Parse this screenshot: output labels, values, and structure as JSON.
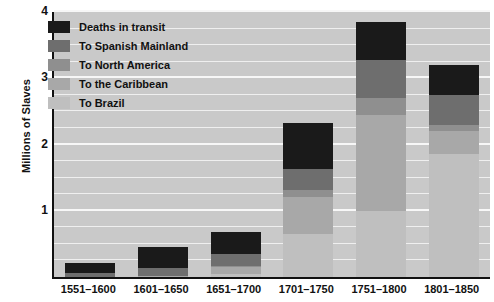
{
  "chart_data": {
    "type": "bar",
    "subtype": "stacked-bar",
    "title": "",
    "xlabel": "",
    "ylabel": "Millions of Slaves",
    "ylim": [
      0,
      4
    ],
    "yticks": [
      0,
      1,
      2,
      3,
      4
    ],
    "ytick_labels": [
      "",
      "1",
      "2",
      "3",
      "4"
    ],
    "grid": true,
    "grid_axis": "y",
    "grid_minor_step": 0.25,
    "legend_position": "upper-left-inside",
    "categories": [
      "1551–1600",
      "1601–1650",
      "1651–1700",
      "1701–1750",
      "1751–1800",
      "1801–1850"
    ],
    "series": [
      {
        "name": "To Brazil",
        "color": "#bfbfbf",
        "values": [
          0.0,
          0.0,
          0.05,
          0.65,
          1.0,
          1.85
        ]
      },
      {
        "name": "To the Caribbean",
        "color": "#a8a8a8",
        "values": [
          0.0,
          0.02,
          0.1,
          0.55,
          1.45,
          0.35
        ]
      },
      {
        "name": "To North America",
        "color": "#8f8f8f",
        "values": [
          0.0,
          0.0,
          0.02,
          0.12,
          0.25,
          0.1
        ]
      },
      {
        "name": "To Spanish Mainland",
        "color": "#6e6e6e",
        "values": [
          0.06,
          0.12,
          0.18,
          0.31,
          0.58,
          0.45
        ]
      },
      {
        "name": "Deaths in transit",
        "color": "#1a1a1a",
        "values": [
          0.15,
          0.31,
          0.33,
          0.7,
          0.57,
          0.45
        ]
      }
    ],
    "totals": [
      0.21,
      0.45,
      0.68,
      2.33,
      3.85,
      3.2
    ],
    "units": "millions of slaves"
  },
  "legend": {
    "items": [
      {
        "label": "Deaths in transit",
        "color": "#1a1a1a"
      },
      {
        "label": "To Spanish Mainland",
        "color": "#6e6e6e"
      },
      {
        "label": "To North America",
        "color": "#8f8f8f"
      },
      {
        "label": "To the Caribbean",
        "color": "#a8a8a8"
      },
      {
        "label": "To Brazil",
        "color": "#bfbfbf"
      }
    ]
  },
  "axes": {
    "y_title": "Millions of Slaves",
    "y_labels": [
      "4",
      "3",
      "2",
      "1"
    ],
    "x_labels": [
      "1551–1600",
      "1601–1650",
      "1651–1700",
      "1701–1750",
      "1751–1800",
      "1801–1850"
    ]
  },
  "colors": {
    "plot_background": "#c9c9c9",
    "gridline": "#f2f2f2",
    "axis": "#111111",
    "page_background": "#ffffff",
    "text": "#111111"
  }
}
